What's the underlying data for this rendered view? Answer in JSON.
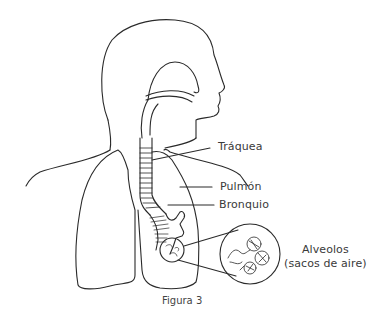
{
  "diagram": {
    "caption": "Figura 3",
    "labels": {
      "trachea": "Tráquea",
      "lung": "Pulmón",
      "bronchus": "Bronquio",
      "alveoli_line1": "Alveolos",
      "alveoli_line2": "(sacos de aire)"
    },
    "colors": {
      "stroke": "#2a2a2a",
      "text": "#3a3a3a",
      "background": "#ffffff"
    }
  }
}
